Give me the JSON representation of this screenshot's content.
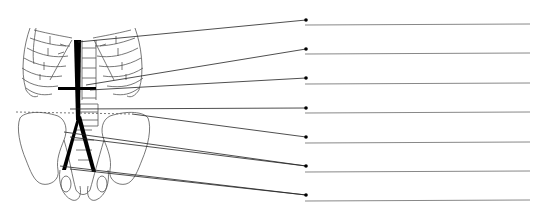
{
  "diagram": {
    "type": "anatomy-labeling-worksheet",
    "colors": {
      "line": "#222222",
      "answer_line": "#888888",
      "vessel": "#000000",
      "outline": "#555555"
    },
    "labels": [
      {
        "index": 1,
        "text": "",
        "dot": [
          306,
          20
        ],
        "line_y": 24,
        "anchors": [
          [
            78,
            42
          ]
        ]
      },
      {
        "index": 2,
        "text": "",
        "dot": [
          306,
          49
        ],
        "line_y": 54,
        "anchors": [
          [
            86,
            85
          ]
        ]
      },
      {
        "index": 3,
        "text": "",
        "dot": [
          306,
          78
        ],
        "line_y": 83,
        "anchors": [
          [
            90,
            90
          ]
        ]
      },
      {
        "index": 4,
        "text": "",
        "dot": [
          306,
          108
        ],
        "line_y": 113,
        "anchors": [
          [
            70,
            109
          ]
        ]
      },
      {
        "index": 5,
        "text": "",
        "dot": [
          306,
          137
        ],
        "line_y": 142,
        "anchors": [
          [
            132,
            114
          ]
        ]
      },
      {
        "index": 6,
        "text": "",
        "dot": [
          306,
          166
        ],
        "line_y": 172,
        "anchors": [
          [
            64,
            132
          ],
          [
            70,
            137
          ]
        ]
      },
      {
        "index": 7,
        "text": "",
        "dot": [
          306,
          195
        ],
        "line_y": 200,
        "anchors": [
          [
            60,
            166
          ],
          [
            70,
            169
          ]
        ]
      }
    ]
  }
}
